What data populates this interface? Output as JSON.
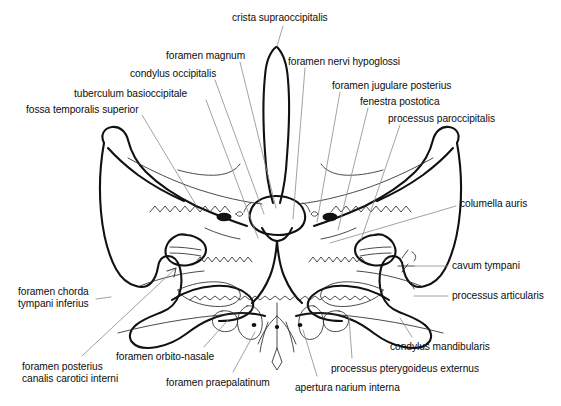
{
  "figure": {
    "kind": "anatomical-line-drawing",
    "background_color": "#ffffff",
    "ink_color": "#111111",
    "leader_line_color": "#8a8a8a"
  },
  "labels": [
    {
      "id": "crista-supraoccipitalis",
      "text": "crista supraoccipitalis",
      "x": 232,
      "y": 12,
      "align": "left"
    },
    {
      "id": "foramen-magnum",
      "text": "foramen magnum",
      "x": 166,
      "y": 50,
      "align": "left"
    },
    {
      "id": "foramen-nervi-hypoglossi",
      "text": "foramen nervi hypoglossi",
      "x": 288,
      "y": 56,
      "align": "left"
    },
    {
      "id": "condylus-occipitalis",
      "text": "condylus occipitalis",
      "x": 130,
      "y": 68,
      "align": "left"
    },
    {
      "id": "foramen-jugulare-posterius",
      "text": "foramen jugulare posterius",
      "x": 332,
      "y": 80,
      "align": "left"
    },
    {
      "id": "tuberculum-basioccipitale",
      "text": "tuberculum basioccipitale",
      "x": 74,
      "y": 88,
      "align": "left"
    },
    {
      "id": "fenestra-postotica",
      "text": "fenestra postotica",
      "x": 360,
      "y": 96,
      "align": "left"
    },
    {
      "id": "fossa-temporalis-superior",
      "text": "fossa temporalis superior",
      "x": 26,
      "y": 104,
      "align": "left"
    },
    {
      "id": "processus-paroccipitalis",
      "text": "processus paroccipitalis",
      "x": 388,
      "y": 113,
      "align": "left"
    },
    {
      "id": "columella-auris",
      "text": "columella auris",
      "x": 460,
      "y": 203,
      "align": "left"
    },
    {
      "id": "cavum-tympani",
      "text": "cavum tympani",
      "x": 452,
      "y": 263,
      "align": "left"
    },
    {
      "id": "processus-articularis",
      "text": "processus articularis",
      "x": 452,
      "y": 293,
      "align": "left"
    },
    {
      "id": "foramen-chorda-tympani-inferius",
      "text": "foramen chorda\ntympani inferius",
      "x": 18,
      "y": 286,
      "align": "left"
    },
    {
      "id": "condylus-mandibularis",
      "text": "condylus mandibularis",
      "x": 390,
      "y": 341,
      "align": "left"
    },
    {
      "id": "foramen-orbito-nasale",
      "text": "foramen orbito-nasale",
      "x": 116,
      "y": 351,
      "align": "left"
    },
    {
      "id": "processus-pterygoideus-externus",
      "text": "processus pterygoideus externus",
      "x": 331,
      "y": 363,
      "align": "left"
    },
    {
      "id": "foramen-posterius-canalis",
      "text": "foramen posterius\ncanalis carotici interni",
      "x": 22,
      "y": 361,
      "align": "left"
    },
    {
      "id": "foramen-praepalatinum",
      "text": "foramen praepalatinum",
      "x": 166,
      "y": 377,
      "align": "left"
    },
    {
      "id": "apertura-narium-interna",
      "text": "apertura narium interna",
      "x": 295,
      "y": 382,
      "align": "left"
    }
  ],
  "leader_lines": [
    {
      "id": "leader-crista-supraoccipitalis",
      "from": [
        283,
        26
      ],
      "to": [
        277,
        46
      ]
    },
    {
      "id": "leader-foramen-magnum",
      "from": [
        240,
        62
      ],
      "to": [
        276,
        208
      ]
    },
    {
      "id": "leader-foramen-nervi-hypoglossi",
      "from": [
        305,
        68
      ],
      "to": [
        293,
        219
      ]
    },
    {
      "id": "leader-condylus-occipitalis",
      "from": [
        215,
        80
      ],
      "to": [
        264,
        214
      ]
    },
    {
      "id": "leader-foramen-jugulare-posterius",
      "from": [
        340,
        92
      ],
      "to": [
        317,
        222
      ]
    },
    {
      "id": "leader-tuberculum-basioccipitale",
      "from": [
        206,
        100
      ],
      "to": [
        258,
        238
      ]
    },
    {
      "id": "leader-fenestra-postotica",
      "from": [
        368,
        108
      ],
      "to": [
        338,
        230
      ]
    },
    {
      "id": "leader-fossa-temporalis-superior",
      "from": [
        142,
        115
      ],
      "to": [
        196,
        205
      ]
    },
    {
      "id": "leader-processus-paroccipitalis",
      "from": [
        400,
        125
      ],
      "to": [
        361,
        240
      ]
    },
    {
      "id": "leader-columella-auris",
      "from": [
        456,
        206
      ],
      "to": [
        330,
        243
      ]
    },
    {
      "id": "leader-cavum-tympani",
      "from": [
        448,
        266
      ],
      "to": [
        414,
        266
      ]
    },
    {
      "id": "leader-processus-articularis",
      "from": [
        448,
        296
      ],
      "to": [
        414,
        296
      ]
    },
    {
      "id": "leader-foramen-chorda-tympani-inferius",
      "from": [
        96,
        299
      ],
      "to": [
        111,
        297
      ]
    },
    {
      "id": "leader-condylus-mandibularis",
      "from": [
        412,
        337
      ],
      "to": [
        400,
        318
      ]
    },
    {
      "id": "leader-foramen-orbito-nasale",
      "from": [
        204,
        347
      ],
      "to": [
        228,
        320
      ]
    },
    {
      "id": "leader-processus-pterygoideus-externus",
      "from": [
        352,
        358
      ],
      "to": [
        349,
        318
      ]
    },
    {
      "id": "leader-foramen-posterius-canalis",
      "from": [
        82,
        356
      ],
      "to": [
        176,
        268
      ]
    },
    {
      "id": "leader-foramen-praepalatinum",
      "from": [
        233,
        372
      ],
      "to": [
        255,
        332
      ]
    },
    {
      "id": "leader-apertura-narium-interna",
      "from": [
        317,
        376
      ],
      "to": [
        303,
        330
      ]
    }
  ]
}
